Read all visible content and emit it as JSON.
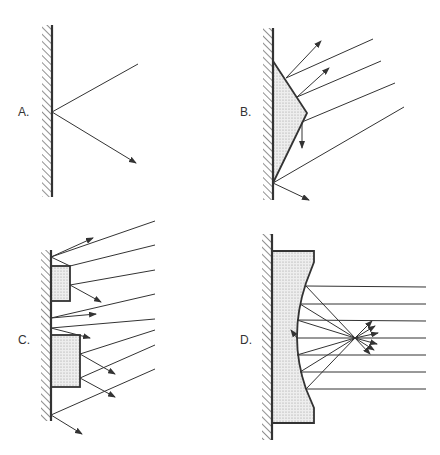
{
  "panels": [
    {
      "id": "A",
      "label": "A."
    },
    {
      "id": "B",
      "label": "B."
    },
    {
      "id": "C",
      "label": "C."
    },
    {
      "id": "D",
      "label": "D."
    }
  ],
  "colors": {
    "line": "#333333",
    "fill": "#e4e4e4",
    "background": "#ffffff"
  }
}
